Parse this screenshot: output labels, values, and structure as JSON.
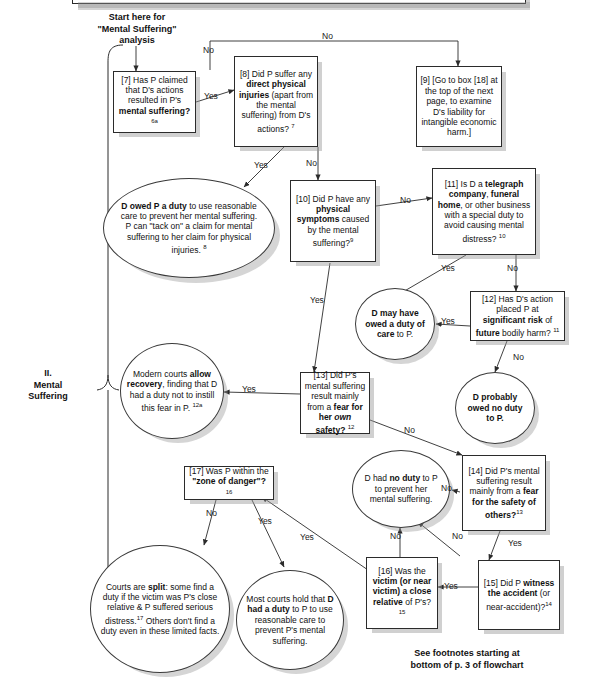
{
  "document": {
    "title": "Mental Suffering analysis flowchart",
    "section_label": "II.\nMental\nSuffering",
    "start_label": "Start here for\n\"Mental Suffering\"\nanalysis",
    "footnote_note": "See footnotes starting at\nbottom of p. 3 of flowchart"
  },
  "colors": {
    "stroke": "#2b2b2b",
    "shadow": "#969696",
    "background": "#ffffff",
    "text": "#111111"
  },
  "nodes": [
    {
      "id": "n7",
      "shape": "box",
      "html": "[7] Has P claimed that D's actions resulted in P's <b>mental suffering?</b> <sup>6a</sup>",
      "plain": "[7] Has P claimed that D's actions resulted in P's mental suffering? 6a"
    },
    {
      "id": "n8",
      "shape": "box",
      "html": "[8] Did P suffer any <b>direct physical injuries</b> (apart from the mental suffering) from D's actions? <sup>7</sup>",
      "plain": "[8] Did P suffer any direct physical injuries (apart from the mental suffering) from D's actions? 7"
    },
    {
      "id": "n9",
      "shape": "box",
      "html": "[9] [Go to box [18] at the top of the next page, to examine D's liability for intangible economic harm.]",
      "plain": "[9] [Go to box [18] at the top of the next page, to examine D's liability for intangible economic harm.]"
    },
    {
      "id": "duty-tack-on",
      "shape": "ellipse",
      "html": "<b>D owed P a duty</b> to use reasonable care to prevent her mental suffering. P can \"tack on\" a claim for mental suffering to her claim for physical injuries. <sup>8</sup>",
      "plain": "D owed P a duty to use reasonable care to prevent her mental suffering. P can \"tack on\" a claim for mental suffering to her claim for physical injuries. 8"
    },
    {
      "id": "n10",
      "shape": "box",
      "html": "[10] Did P have any <b>physical symptoms</b> caused by the mental suffering?<sup>9</sup>",
      "plain": "[10] Did P have any physical symptoms caused by the mental suffering?9"
    },
    {
      "id": "n11",
      "shape": "box",
      "html": "[11] Is D a <b>telegraph company</b>, <b>funeral home</b>, or other business with a special duty to avoid causing mental distress? <sup>10</sup>",
      "plain": "[11] Is D a telegraph company, funeral home, or other business with a special duty to avoid causing mental distress? 10"
    },
    {
      "id": "may-have-owed",
      "shape": "circle",
      "html": "<b>D may have owed a duty  of care</b> to P.",
      "plain": "D may have owed a duty of care to P."
    },
    {
      "id": "n12",
      "shape": "box",
      "html": "[12] Has D's action placed P at <b>significant risk</b> of <b>future</b> bodily harm? <sup>11</sup>",
      "plain": "[12] Has D's action placed P at significant risk of future bodily harm? 11"
    },
    {
      "id": "probably-no-duty",
      "shape": "circle",
      "html": "<b>D probably owed no duty to P.</b>",
      "plain": "D probably owed no duty to P."
    },
    {
      "id": "modern-courts",
      "shape": "circle",
      "html": "Modern courts <b>allow recovery</b>, finding that D had a duty not to instill this fear in P. <sup>12a</sup>",
      "plain": "Modern courts allow recovery, finding that D had a duty not to instill this fear in P. 12a"
    },
    {
      "id": "n13",
      "shape": "box",
      "html": "[13] Did P's mental suffering result mainly from a <b>fear for her <i>own</i> safety?</b> <sup>12</sup>",
      "plain": "[13] Did P's mental suffering result mainly from a fear for her own safety? 12"
    },
    {
      "id": "no-duty",
      "shape": "circle",
      "html": "D had <b>no duty</b> to P to prevent her mental suffering.",
      "plain": "D had no duty to P to prevent her mental suffering."
    },
    {
      "id": "n14",
      "shape": "box",
      "html": "[14] Did P's mental suffering result mainly from a <b>fear for the safety of others?</b><sup>13</sup>",
      "plain": "[14] Did P's mental suffering result mainly from a fear for the safety of others?13"
    },
    {
      "id": "n17",
      "shape": "box",
      "html": "[17] Was P within the <b>\"zone of danger\"?</b> <sup>16</sup>",
      "plain": "[17] Was P within the \"zone of danger\"? 16"
    },
    {
      "id": "courts-split",
      "shape": "circle",
      "html": "Courts are <b>split</b>: some find a duty if the victim was P's close relative &amp; P suffered serious distress.<sup>17</sup> Others don't find a duty even in these limited facts.",
      "plain": "Courts are split: some find a duty if the victim was P's close relative & P suffered serious distress.17 Others don't find a duty even in these limited facts."
    },
    {
      "id": "most-courts",
      "shape": "circle",
      "html": "Most courts hold that <b>D had a duty</b> to P to use reasonable care to prevent P's mental suffering.",
      "plain": "Most courts hold that D had a duty to P to use reasonable care to prevent P's mental suffering."
    },
    {
      "id": "n16",
      "shape": "box",
      "html": "[16] Was the <b>victim (or near victim)</b> <b>a close relative</b> of P's? <sup>15</sup>",
      "plain": "[16] Was the victim (or near victim) a close relative of P's? 15"
    },
    {
      "id": "n15",
      "shape": "box",
      "html": "[15] Did P <b>witness the accident</b> (or near-accident)?<sup>14</sup>",
      "plain": "[15] Did P witness the accident (or near-accident)?14"
    }
  ],
  "edge_labels": [
    {
      "id": "e7-8",
      "text": "Yes"
    },
    {
      "id": "e7-9",
      "text": "No"
    },
    {
      "id": "e7-9b",
      "text": "No"
    },
    {
      "id": "e8-duty",
      "text": "Yes"
    },
    {
      "id": "e8-10",
      "text": "No"
    },
    {
      "id": "e10-11",
      "text": "No"
    },
    {
      "id": "e10-13",
      "text": "Yes"
    },
    {
      "id": "e11-may",
      "text": "Yes"
    },
    {
      "id": "e11-12",
      "text": "No"
    },
    {
      "id": "e12-may",
      "text": "Yes"
    },
    {
      "id": "e12-prob",
      "text": "No"
    },
    {
      "id": "e13-modern",
      "text": "Yes"
    },
    {
      "id": "e13-14",
      "text": "No"
    },
    {
      "id": "e14-noduty",
      "text": "No"
    },
    {
      "id": "e14-15",
      "text": "Yes"
    },
    {
      "id": "e15-16",
      "text": "Yes"
    },
    {
      "id": "e15-noduty",
      "text": "No"
    },
    {
      "id": "e16-noduty",
      "text": "No"
    },
    {
      "id": "e16-17",
      "text": "Yes"
    },
    {
      "id": "e17-split",
      "text": "No"
    },
    {
      "id": "e17-most",
      "text": "Yes"
    }
  ]
}
